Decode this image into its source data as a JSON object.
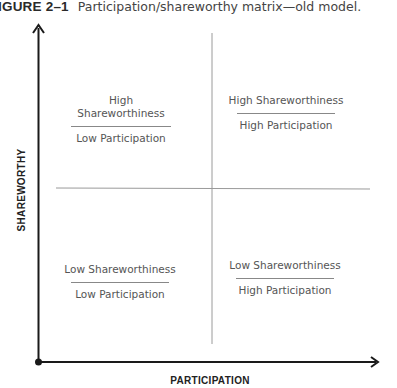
{
  "caption": {
    "figure_label": "IGURE 2–1",
    "title": "Participation/shareworthy matrix—old model."
  },
  "axes": {
    "y_label": "SHAREWORTHY",
    "x_label": "PARTICIPATION"
  },
  "quadrants": {
    "top_left": {
      "line1": "High Shareworthiness",
      "line2": "Low Participation"
    },
    "top_right": {
      "line1": "High Shareworthiness",
      "line2": "High Participation"
    },
    "bottom_left": {
      "line1": "Low Shareworthiness",
      "line2": "Low Participation"
    },
    "bottom_right": {
      "line1": "Low Shareworthiness",
      "line2": "High Participation"
    }
  },
  "colors": {
    "axis": "#1a1a1a",
    "divider": "#9a9a9a",
    "text": "#555555"
  }
}
